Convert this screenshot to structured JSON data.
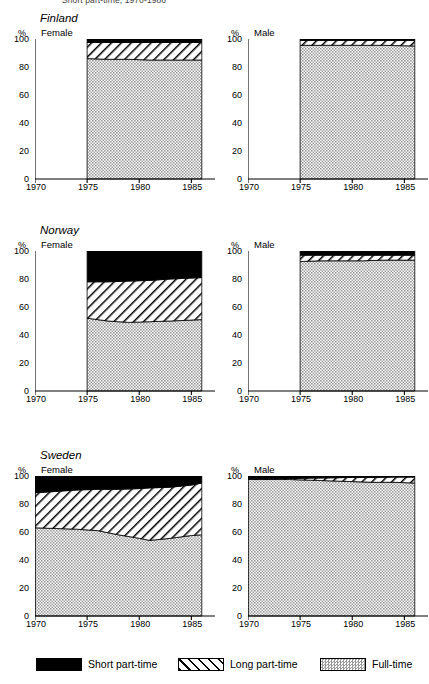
{
  "caption": "Short part-time, 1970-1986",
  "axes": {
    "y_label": "%",
    "y_ticks": [
      0,
      20,
      40,
      60,
      80,
      100
    ],
    "x_ticks": [
      1970,
      1975,
      1980,
      1985
    ],
    "x_min": 1970,
    "x_max": 1986.5,
    "y_min": 0,
    "y_max": 100
  },
  "legend": {
    "position": "bottom",
    "items": [
      {
        "label": "Short part-time",
        "pattern": "solid-black",
        "color": "#000000"
      },
      {
        "label": "Long part-time",
        "pattern": "diagonal-hatch",
        "color": "#ffffff"
      },
      {
        "label": "Full-time",
        "pattern": "stipple-gray",
        "color": "#b4b4b4"
      }
    ]
  },
  "panels": [
    {
      "country": "Finland",
      "sex": "Female",
      "id": "finland-female"
    },
    {
      "country": "Finland",
      "sex": "Male",
      "id": "finland-male"
    },
    {
      "country": "Norway",
      "sex": "Female",
      "id": "norway-female"
    },
    {
      "country": "Norway",
      "sex": "Male",
      "id": "norway-male"
    },
    {
      "country": "Sweden",
      "sex": "Female",
      "id": "sweden-female"
    },
    {
      "country": "Sweden",
      "sex": "Male",
      "id": "sweden-male"
    }
  ],
  "chart_data": [
    {
      "type": "area",
      "title": "Finland Female",
      "xlabel": "",
      "ylabel": "%",
      "xlim": [
        1970,
        1986.5
      ],
      "ylim": [
        0,
        100
      ],
      "x": [
        1975,
        1977,
        1979,
        1981,
        1983,
        1986
      ],
      "stacked": true,
      "series": [
        {
          "name": "Full-time",
          "values": [
            86,
            85.5,
            85.5,
            85,
            85,
            85
          ]
        },
        {
          "name": "Long part-time",
          "values": [
            11.5,
            12,
            12,
            12.5,
            12.5,
            12.5
          ]
        },
        {
          "name": "Short part-time",
          "values": [
            2.5,
            2.5,
            2.5,
            2.5,
            2.5,
            2.5
          ]
        }
      ]
    },
    {
      "type": "area",
      "title": "Finland Male",
      "xlabel": "",
      "ylabel": "%",
      "xlim": [
        1970,
        1986.5
      ],
      "ylim": [
        0,
        100
      ],
      "x": [
        1975,
        1977,
        1979,
        1981,
        1983,
        1986
      ],
      "stacked": true,
      "series": [
        {
          "name": "Full-time",
          "values": [
            95.5,
            95.5,
            95.5,
            95.5,
            95.5,
            95
          ]
        },
        {
          "name": "Long part-time",
          "values": [
            3.5,
            3.5,
            3.5,
            3.5,
            3.5,
            4
          ]
        },
        {
          "name": "Short part-time",
          "values": [
            1,
            1,
            1,
            1,
            1,
            1
          ]
        }
      ]
    },
    {
      "type": "area",
      "title": "Norway Female",
      "xlabel": "",
      "ylabel": "%",
      "xlim": [
        1970,
        1986.5
      ],
      "ylim": [
        0,
        100
      ],
      "x": [
        1975,
        1977,
        1979,
        1981,
        1983,
        1986
      ],
      "stacked": true,
      "series": [
        {
          "name": "Full-time",
          "values": [
            52,
            50,
            49,
            49.5,
            50,
            51
          ]
        },
        {
          "name": "Long part-time",
          "values": [
            26,
            28,
            29.5,
            29.5,
            30,
            30
          ]
        },
        {
          "name": "Short part-time",
          "values": [
            22,
            22,
            21.5,
            21,
            20,
            19
          ]
        }
      ]
    },
    {
      "type": "area",
      "title": "Norway Male",
      "xlabel": "",
      "ylabel": "%",
      "xlim": [
        1970,
        1986.5
      ],
      "ylim": [
        0,
        100
      ],
      "x": [
        1975,
        1977,
        1979,
        1981,
        1983,
        1986
      ],
      "stacked": true,
      "series": [
        {
          "name": "Full-time",
          "values": [
            92.5,
            93,
            93,
            93,
            93.5,
            93.5
          ]
        },
        {
          "name": "Long part-time",
          "values": [
            4.5,
            4,
            4,
            4,
            3.5,
            3.5
          ]
        },
        {
          "name": "Short part-time",
          "values": [
            3,
            3,
            3,
            3,
            3,
            3
          ]
        }
      ]
    },
    {
      "type": "area",
      "title": "Sweden Female",
      "xlabel": "",
      "ylabel": "%",
      "xlim": [
        1970,
        1986.5
      ],
      "ylim": [
        0,
        100
      ],
      "x": [
        1970,
        1972,
        1974,
        1976,
        1978,
        1980,
        1981,
        1983,
        1985,
        1986
      ],
      "stacked": true,
      "series": [
        {
          "name": "Full-time",
          "values": [
            63,
            62.5,
            62,
            61,
            58,
            55.5,
            54,
            55.5,
            57.5,
            58
          ]
        },
        {
          "name": "Long part-time",
          "values": [
            25,
            26.5,
            28,
            29.5,
            32.5,
            35.5,
            37.5,
            36.5,
            36,
            37
          ]
        },
        {
          "name": "Short part-time",
          "values": [
            12,
            11,
            10,
            9.5,
            9.5,
            9,
            8.5,
            8,
            6.5,
            5
          ]
        }
      ]
    },
    {
      "type": "area",
      "title": "Sweden Male",
      "xlabel": "",
      "ylabel": "%",
      "xlim": [
        1970,
        1986.5
      ],
      "ylim": [
        0,
        100
      ],
      "x": [
        1970,
        1972,
        1974,
        1976,
        1978,
        1980,
        1982,
        1984,
        1986
      ],
      "stacked": true,
      "series": [
        {
          "name": "Full-time",
          "values": [
            97.5,
            97.5,
            97.5,
            97,
            96.5,
            96,
            95.5,
            95.5,
            95
          ]
        },
        {
          "name": "Long part-time",
          "values": [
            0.5,
            0.5,
            0.7,
            1.5,
            2.2,
            3,
            3.5,
            3.7,
            4.2
          ]
        },
        {
          "name": "Short part-time",
          "values": [
            2,
            2,
            1.8,
            1.5,
            1.3,
            1,
            1,
            0.8,
            0.8
          ]
        }
      ]
    }
  ]
}
